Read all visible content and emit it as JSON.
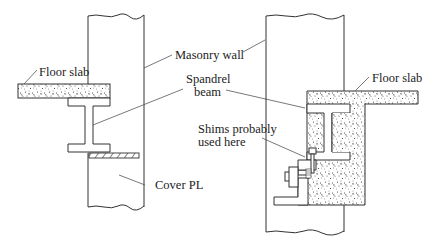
{
  "figure": {
    "left_detail": {
      "labels": {
        "floor_slab": "Floor slab",
        "cover_pl": "Cover PL"
      }
    },
    "shared_labels": {
      "masonry_wall": "Masonry wall",
      "spandrel_beam_line1": "Spandrel",
      "spandrel_beam_line2": "beam"
    },
    "right_detail": {
      "labels": {
        "floor_slab": "Floor slab",
        "shims_line1": "Shims probably",
        "shims_line2": "used here"
      }
    }
  }
}
